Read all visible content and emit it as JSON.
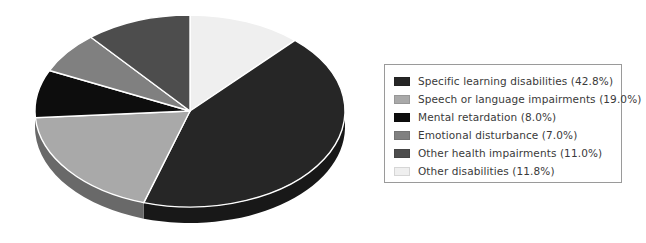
{
  "chart_data": {
    "type": "pie",
    "title": "",
    "subtitle": "",
    "xlabel": "",
    "ylabel": "",
    "three_d": true,
    "start_angle_deg": 0,
    "direction": "clockwise",
    "legend_position": "right",
    "grid": false,
    "categories": [
      "Specific learning disabilities",
      "Speech or language impairments",
      "Mental retardation",
      "Emotional disturbance",
      "Other health impairments",
      "Other disabilities"
    ],
    "values": [
      42.8,
      19.0,
      8.0,
      7.0,
      11.0,
      11.8
    ],
    "value_unit": "%",
    "slice_colors": [
      "#262626",
      "#a9a9a9",
      "#0d0d0d",
      "#808080",
      "#4d4d4d",
      "#efefef"
    ],
    "slice_order_clockwise_from_top": [
      "Other disabilities",
      "Specific learning disabilities",
      "Speech or language impairments",
      "Mental retardation",
      "Emotional disturbance",
      "Other health impairments"
    ],
    "annotations": []
  },
  "legend": {
    "items": [
      {
        "label": "Specific learning disabilities (42.8%)",
        "color": "#262626",
        "swatch_name": "swatch-specific-learning-disabilities"
      },
      {
        "label": "Speech or language impairments (19.0%)",
        "color": "#a9a9a9",
        "swatch_name": "swatch-speech-or-language-impairments"
      },
      {
        "label": "Mental retardation (8.0%)",
        "color": "#0d0d0d",
        "swatch_name": "swatch-mental-retardation"
      },
      {
        "label": "Emotional disturbance (7.0%)",
        "color": "#808080",
        "swatch_name": "swatch-emotional-disturbance"
      },
      {
        "label": "Other health impairments (11.0%)",
        "color": "#4d4d4d",
        "swatch_name": "swatch-other-health-impairments"
      },
      {
        "label": "Other disabilities (11.8%)",
        "color": "#efefef",
        "swatch_name": "swatch-other-disabilities"
      }
    ]
  },
  "style": {
    "background": "#ffffff",
    "legend_border": "#9a9a9a",
    "legend_text": "#3a3a3a"
  }
}
